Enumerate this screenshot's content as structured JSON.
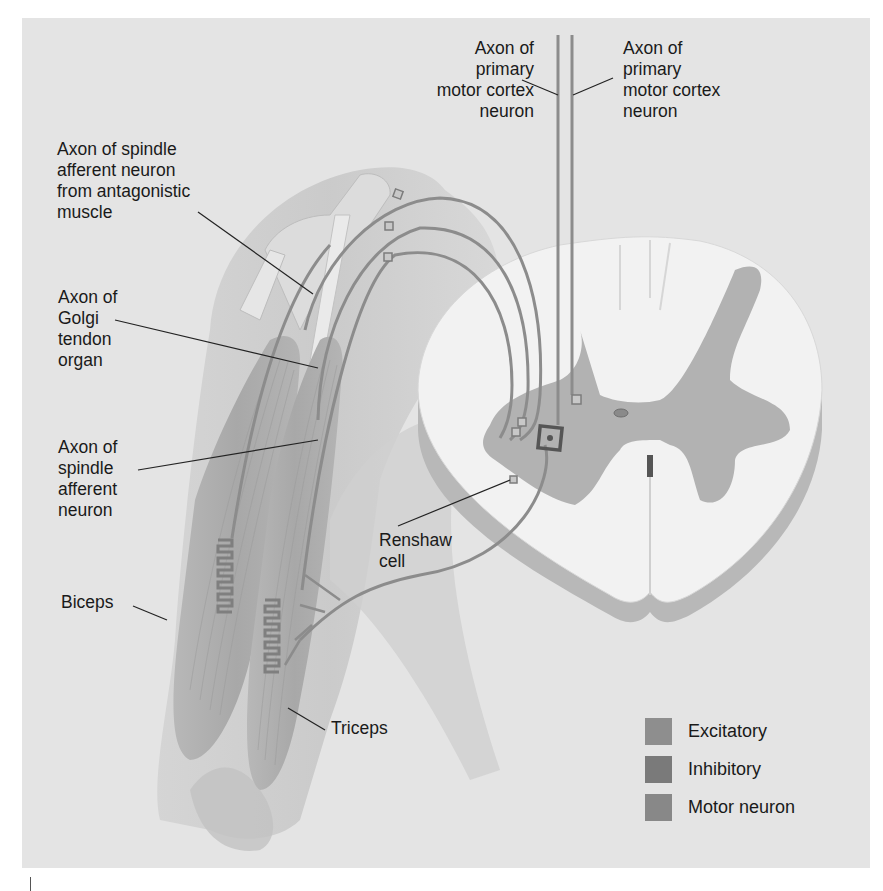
{
  "figure": {
    "background_color": "#e4e4e4",
    "neuron_color": "#8c8c8c",
    "labels": {
      "axon_primary_motor_left": "Axon of\nprimary\nmotor cortex\nneuron",
      "axon_primary_motor_right": "Axon of\nprimary\nmotor cortex\nneuron",
      "axon_spindle_antagonistic": "Axon of spindle\nafferent neuron\nfrom antagonistic\nmuscle",
      "axon_golgi_tendon": "Axon of\nGolgi\ntendon\norgan",
      "axon_spindle_afferent": "Axon of\nspindle\nafferent\nneuron",
      "renshaw_cell": "Renshaw\ncell",
      "biceps": "Biceps",
      "triceps": "Triceps"
    },
    "legend": [
      {
        "label": "Excitatory",
        "color": "#8e8e8e"
      },
      {
        "label": "Inhibitory",
        "color": "#7a7a7a"
      },
      {
        "label": "Motor neuron",
        "color": "#888888"
      }
    ]
  }
}
